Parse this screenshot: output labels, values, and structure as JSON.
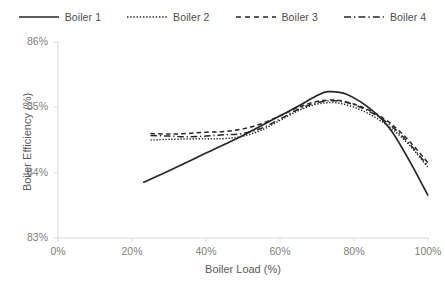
{
  "chart_data": {
    "type": "line",
    "title": "",
    "xlabel": "Boiler Load (%)",
    "ylabel": "Boiler Efficiency (%)",
    "xlim": [
      0,
      100
    ],
    "ylim": [
      83,
      86
    ],
    "xticks": [
      "0%",
      "20%",
      "40%",
      "60%",
      "80%",
      "100%"
    ],
    "xtick_values": [
      0,
      20,
      40,
      60,
      80,
      100
    ],
    "yticks": [
      "83%",
      "84%",
      "85%",
      "86%"
    ],
    "ytick_values": [
      83,
      84,
      85,
      86
    ],
    "grid": false,
    "legend_position": "top",
    "series": [
      {
        "name": "Boiler 1",
        "style": "solid",
        "color": "#262626",
        "x": [
          23,
          30,
          40,
          50,
          60,
          65,
          70,
          73,
          78,
          85,
          90,
          95,
          100
        ],
        "y": [
          83.85,
          84.03,
          84.3,
          84.57,
          84.87,
          85.02,
          85.18,
          85.24,
          85.2,
          84.95,
          84.65,
          84.18,
          83.65
        ]
      },
      {
        "name": "Boiler 2",
        "style": "dotted",
        "color": "#262626",
        "x": [
          25,
          30,
          40,
          45,
          50,
          55,
          60,
          65,
          70,
          75,
          80,
          85,
          90,
          95,
          100
        ],
        "y": [
          84.5,
          84.51,
          84.52,
          84.52,
          84.56,
          84.65,
          84.8,
          84.95,
          85.05,
          85.07,
          85.0,
          84.87,
          84.68,
          84.42,
          84.08
        ]
      },
      {
        "name": "Boiler 3",
        "style": "dashed",
        "color": "#262626",
        "x": [
          25,
          30,
          35,
          40,
          45,
          50,
          55,
          60,
          65,
          70,
          75,
          80,
          85,
          90,
          95,
          100
        ],
        "y": [
          84.6,
          84.59,
          84.6,
          84.62,
          84.63,
          84.67,
          84.75,
          84.87,
          85.0,
          85.09,
          85.11,
          85.05,
          84.93,
          84.75,
          84.48,
          84.15
        ]
      },
      {
        "name": "Boiler 4",
        "style": "dash-dot",
        "color": "#262626",
        "x": [
          25,
          30,
          35,
          40,
          45,
          50,
          55,
          60,
          65,
          70,
          75,
          80,
          85,
          90,
          95,
          100
        ],
        "y": [
          84.57,
          84.56,
          84.55,
          84.56,
          84.58,
          84.6,
          84.68,
          84.82,
          84.97,
          85.07,
          85.1,
          85.04,
          84.91,
          84.72,
          84.44,
          84.1
        ]
      }
    ]
  },
  "legend": {
    "items": [
      {
        "label": "Boiler 1"
      },
      {
        "label": "Boiler 2"
      },
      {
        "label": "Boiler 3"
      },
      {
        "label": "Boiler 4"
      }
    ]
  },
  "axes": {
    "x_title": "Boiler Load (%)",
    "y_title": "Boiler Efficiency (%)"
  },
  "colors": {
    "line": "#262626",
    "axis": "#d9d9d9",
    "tick_text": "#808080",
    "title_text": "#595959",
    "background": "#ffffff"
  }
}
